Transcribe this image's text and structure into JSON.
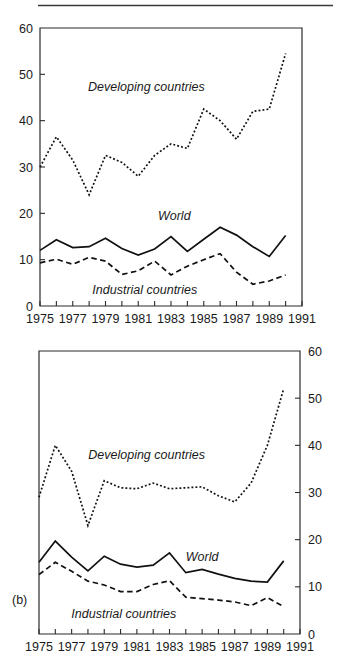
{
  "figure": {
    "background_color": "#ffffff",
    "line_color": "#111111",
    "axis_color": "#2b2b2b",
    "top_rule": true
  },
  "panels": [
    {
      "id": "panel-a",
      "label": "",
      "y_axis_side": "left",
      "chart_data": {
        "type": "line",
        "title": "",
        "subtitle": "",
        "xlabel": "",
        "ylabel": "",
        "xlim": [
          1975,
          1991
        ],
        "ylim": [
          0,
          60
        ],
        "yticks": [
          0,
          10,
          20,
          30,
          40,
          50,
          60
        ],
        "ytick_labels": [
          "0",
          "10",
          "20",
          "30",
          "40",
          "50",
          "60"
        ],
        "xticks": [
          1975,
          1976,
          1977,
          1978,
          1979,
          1980,
          1981,
          1982,
          1983,
          1984,
          1985,
          1986,
          1987,
          1988,
          1989,
          1990,
          1991
        ],
        "xtick_labels": [
          "1975",
          "1977",
          "1979",
          "1981",
          "1983",
          "1985",
          "1987",
          "1989",
          "1991"
        ],
        "xtick_labels_values": [
          1975,
          1977,
          1979,
          1981,
          1983,
          1985,
          1987,
          1989,
          1991
        ],
        "grid": false,
        "legend_position": "inline-annotation",
        "x": [
          1975,
          1976,
          1977,
          1978,
          1979,
          1980,
          1981,
          1982,
          1983,
          1984,
          1985,
          1986,
          1987,
          1988,
          1989,
          1990
        ],
        "series": [
          {
            "name": "Developing countries",
            "style": "dotted",
            "values": [
              30.0,
              36.5,
              31.5,
              24.0,
              32.5,
              31.0,
              28.0,
              32.5,
              35.0,
              34.0,
              42.5,
              40.0,
              36.0,
              42.0,
              42.5,
              54.5
            ],
            "label_x": 1981.5,
            "label_y": 46.5
          },
          {
            "name": "World",
            "style": "solid",
            "values": [
              12.0,
              14.3,
              12.6,
              12.8,
              14.6,
              12.4,
              11.0,
              12.3,
              15.0,
              11.8,
              14.4,
              17.0,
              15.3,
              12.8,
              10.7,
              15.2
            ],
            "label_x": 1983.2,
            "label_y": 18.6
          },
          {
            "name": "Industrial countries",
            "style": "dashed",
            "values": [
              9.3,
              10.1,
              9.0,
              10.5,
              9.7,
              6.8,
              7.6,
              9.7,
              6.7,
              8.6,
              10.0,
              11.3,
              7.3,
              4.7,
              5.4,
              6.7
            ],
            "label_x": 1981.4,
            "label_y": 2.6
          }
        ]
      }
    },
    {
      "id": "panel-b",
      "label": "(b)",
      "y_axis_side": "right",
      "chart_data": {
        "type": "line",
        "title": "",
        "subtitle": "",
        "xlabel": "",
        "ylabel": "",
        "xlim": [
          1975,
          1991
        ],
        "ylim": [
          0,
          60
        ],
        "yticks": [
          0,
          10,
          20,
          30,
          40,
          50,
          60
        ],
        "ytick_labels": [
          "0",
          "10",
          "20",
          "30",
          "40",
          "50",
          "60"
        ],
        "xticks": [
          1975,
          1976,
          1977,
          1978,
          1979,
          1980,
          1981,
          1982,
          1983,
          1984,
          1985,
          1986,
          1987,
          1988,
          1989,
          1990,
          1991
        ],
        "xtick_labels": [
          "1975",
          "1977",
          "1979",
          "1981",
          "1983",
          "1985",
          "1987",
          "1989",
          "1991"
        ],
        "xtick_labels_values": [
          1975,
          1977,
          1979,
          1981,
          1983,
          1985,
          1987,
          1989,
          1991
        ],
        "grid": false,
        "legend_position": "inline-annotation",
        "x": [
          1975,
          1976,
          1977,
          1978,
          1979,
          1980,
          1981,
          1982,
          1983,
          1984,
          1985,
          1986,
          1987,
          1988,
          1989,
          1990
        ],
        "series": [
          {
            "name": "Developing countries",
            "style": "dotted",
            "values": [
              29.0,
              40.0,
              34.5,
              23.0,
              32.5,
              31.0,
              30.8,
              32.0,
              30.8,
              31.0,
              31.2,
              29.3,
              28.0,
              32.0,
              40.0,
              52.0
            ],
            "label_x": 1981.6,
            "label_y": 37.0
          },
          {
            "name": "World",
            "style": "solid",
            "values": [
              15.2,
              19.7,
              16.3,
              13.4,
              16.5,
              14.8,
              14.2,
              14.6,
              17.2,
              13.0,
              13.7,
              12.7,
              11.8,
              11.2,
              11.0,
              15.5
            ],
            "label_x": 1985.0,
            "label_y": 15.5
          },
          {
            "name": "Industrial countries",
            "style": "dashed",
            "values": [
              12.6,
              15.2,
              13.3,
              11.2,
              10.4,
              9.0,
              9.0,
              10.5,
              11.3,
              7.8,
              7.5,
              7.2,
              6.8,
              6.0,
              7.7,
              5.8
            ],
            "label_x": 1980.2,
            "label_y": 3.4
          }
        ]
      }
    }
  ]
}
